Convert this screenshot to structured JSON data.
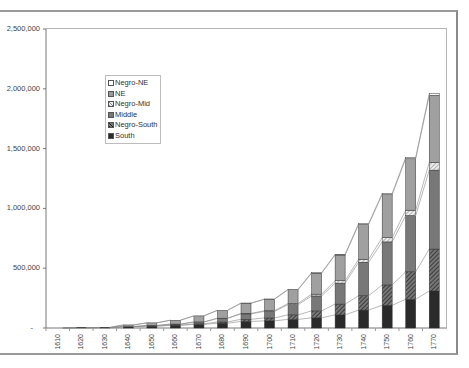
{
  "chart_data": {
    "type": "bar",
    "stacked": true,
    "title": "",
    "xlabel": "",
    "ylabel": "",
    "ylim": [
      0,
      2500000
    ],
    "yticks": [
      "2,500,000",
      "2,000,000",
      "1,500,000",
      "1,000,000",
      "500,000",
      "-"
    ],
    "grid": false,
    "legend_position": "upper-left inside plot",
    "series_connector_lines": true,
    "categories": [
      "1610",
      "1620",
      "1630",
      "1640",
      "1650",
      "1660",
      "1670",
      "1680",
      "1690",
      "1700",
      "1710",
      "1720",
      "1730",
      "1740",
      "1750",
      "1760",
      "1770"
    ],
    "series": [
      {
        "name": "South",
        "color": "#2a2a2a",
        "pattern": "solid-dark",
        "values": [
          350,
          2400,
          3000,
          10000,
          15000,
          22000,
          30000,
          40000,
          55000,
          60000,
          72000,
          85000,
          110000,
          150000,
          190000,
          240000,
          310000
        ]
      },
      {
        "name": "Negro-South",
        "color": "#555555",
        "pattern": "diagonal-hatch",
        "values": [
          0,
          0,
          100,
          400,
          1500,
          3000,
          5000,
          10000,
          18000,
          24000,
          38000,
          58000,
          90000,
          120000,
          170000,
          230000,
          350000
        ]
      },
      {
        "name": "Middle",
        "color": "#777777",
        "pattern": "solid-mid",
        "values": [
          0,
          0,
          0,
          1500,
          4000,
          7000,
          15000,
          30000,
          45000,
          55000,
          85000,
          125000,
          175000,
          280000,
          360000,
          470000,
          660000
        ]
      },
      {
        "name": "Negro-Mid",
        "color": "#cccccc",
        "pattern": "light-hatch",
        "values": [
          0,
          0,
          0,
          200,
          500,
          800,
          1200,
          2000,
          4000,
          6000,
          10000,
          15000,
          20000,
          25000,
          35000,
          45000,
          65000
        ]
      },
      {
        "name": "NE",
        "color": "#9a9a9a",
        "pattern": "solid-light",
        "values": [
          0,
          0,
          1800,
          13500,
          22000,
          32000,
          50000,
          65000,
          85000,
          95000,
          115000,
          175000,
          215000,
          290000,
          360000,
          430000,
          560000
        ]
      },
      {
        "name": "Negro-NE",
        "color": "#ffffff",
        "pattern": "outline",
        "values": [
          0,
          0,
          0,
          200,
          600,
          600,
          800,
          1000,
          1700,
          2700,
          4000,
          5000,
          6000,
          8500,
          11000,
          12000,
          15000
        ]
      }
    ]
  },
  "legend": {
    "items": [
      {
        "label": "Negro-NE",
        "color": "#ffffff"
      },
      {
        "label": "NE",
        "color": "#9a9a9a"
      },
      {
        "label": "Negro-Mid",
        "color": "#cccccc"
      },
      {
        "label": "Middle",
        "color": "#777777"
      },
      {
        "label": "Negro-South",
        "color": "#555555"
      },
      {
        "label": "South",
        "color": "#2a2a2a"
      }
    ]
  }
}
